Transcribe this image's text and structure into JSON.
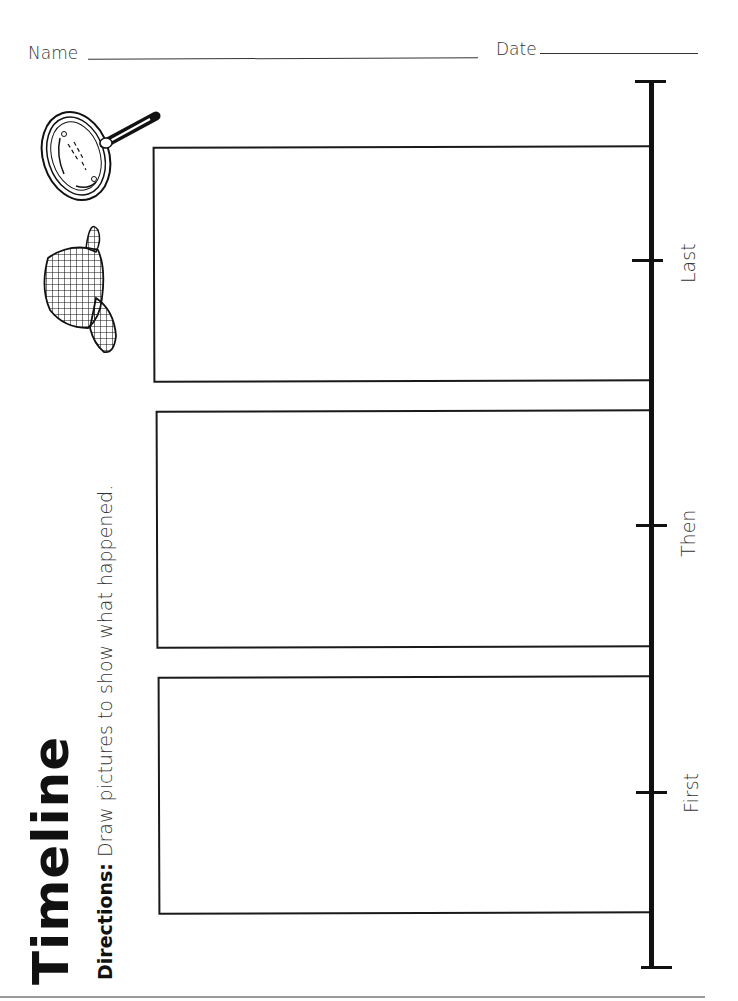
{
  "header": {
    "name_label": "Name",
    "date_label": "Date"
  },
  "title": "Timeline",
  "directions": {
    "label": "Directions:",
    "text": " Draw pictures to show what happened."
  },
  "clipart": [
    "magnifying-glass",
    "cap"
  ],
  "timeline": {
    "steps": [
      {
        "label": "Last"
      },
      {
        "label": "Then"
      },
      {
        "label": "First"
      }
    ]
  },
  "colors": {
    "ink": "#111111",
    "paper": "#ffffff"
  }
}
